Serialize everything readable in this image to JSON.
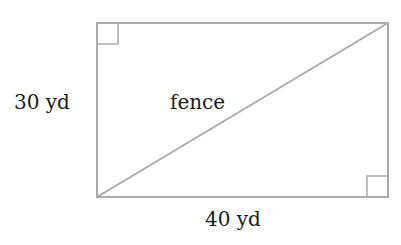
{
  "diagram": {
    "shape": "rectangle",
    "labels": {
      "height": "30 yd",
      "width": "40 yd",
      "diagonal": "fence"
    },
    "right_angle_markers": [
      "top-left",
      "bottom-right"
    ],
    "stroke_color": "#aaaaaa"
  }
}
